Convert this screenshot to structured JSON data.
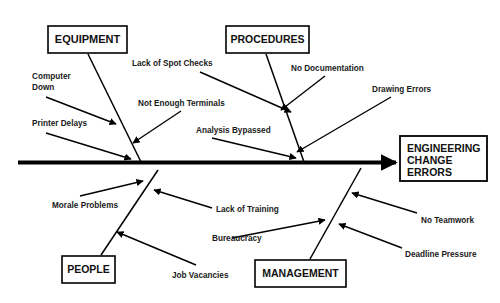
{
  "diagram": {
    "type": "fishbone-cause-and-effect",
    "effect": {
      "lines": [
        "ENGINEERING",
        "CHANGE",
        "ERRORS"
      ]
    },
    "categories": [
      {
        "id": "equipment",
        "label": "EQUIPMENT",
        "position": "top-left"
      },
      {
        "id": "procedures",
        "label": "PROCEDURES",
        "position": "top-right"
      },
      {
        "id": "people",
        "label": "PEOPLE",
        "position": "bottom-left"
      },
      {
        "id": "management",
        "label": "MANAGEMENT",
        "position": "bottom-right"
      }
    ],
    "causes": [
      {
        "id": "computer-down",
        "category": "equipment",
        "lines": [
          "Computer",
          "Down"
        ],
        "text": "Computer Down"
      },
      {
        "id": "printer-delays",
        "category": "equipment",
        "lines": [
          "Printer Delays"
        ],
        "text": "Printer Delays"
      },
      {
        "id": "not-enough-terminals",
        "category": "equipment",
        "lines": [
          "Not Enough Terminals"
        ],
        "text": "Not Enough Terminals"
      },
      {
        "id": "lack-of-spot-checks",
        "category": "procedures",
        "lines": [
          "Lack of Spot Checks"
        ],
        "text": "Lack of Spot Checks"
      },
      {
        "id": "analysis-bypassed",
        "category": "procedures",
        "lines": [
          "Analysis Bypassed"
        ],
        "text": "Analysis Bypassed"
      },
      {
        "id": "no-documentation",
        "category": "procedures",
        "lines": [
          "No Documentation"
        ],
        "text": "No Documentation"
      },
      {
        "id": "drawing-errors",
        "category": "procedures",
        "lines": [
          "Drawing Errors"
        ],
        "text": "Drawing Errors"
      },
      {
        "id": "morale-problems",
        "category": "people",
        "lines": [
          "Morale Problems"
        ],
        "text": "Morale Problems"
      },
      {
        "id": "lack-of-training",
        "category": "people",
        "lines": [
          "Lack of Training"
        ],
        "text": "Lack of Training"
      },
      {
        "id": "job-vacancies",
        "category": "people",
        "lines": [
          "Job Vacancies"
        ],
        "text": "Job Vacancies"
      },
      {
        "id": "bureaucracy",
        "category": "management",
        "lines": [
          "Bureaucracy"
        ],
        "text": "Bureaucracy"
      },
      {
        "id": "no-teamwork",
        "category": "management",
        "lines": [
          "No Teamwork"
        ],
        "text": "No Teamwork"
      },
      {
        "id": "deadline-pressure",
        "category": "management",
        "lines": [
          "Deadline Pressure"
        ],
        "text": "Deadline Pressure"
      }
    ],
    "colors": {
      "ink": "#000000",
      "background": "#ffffff",
      "text": "#111111"
    }
  }
}
